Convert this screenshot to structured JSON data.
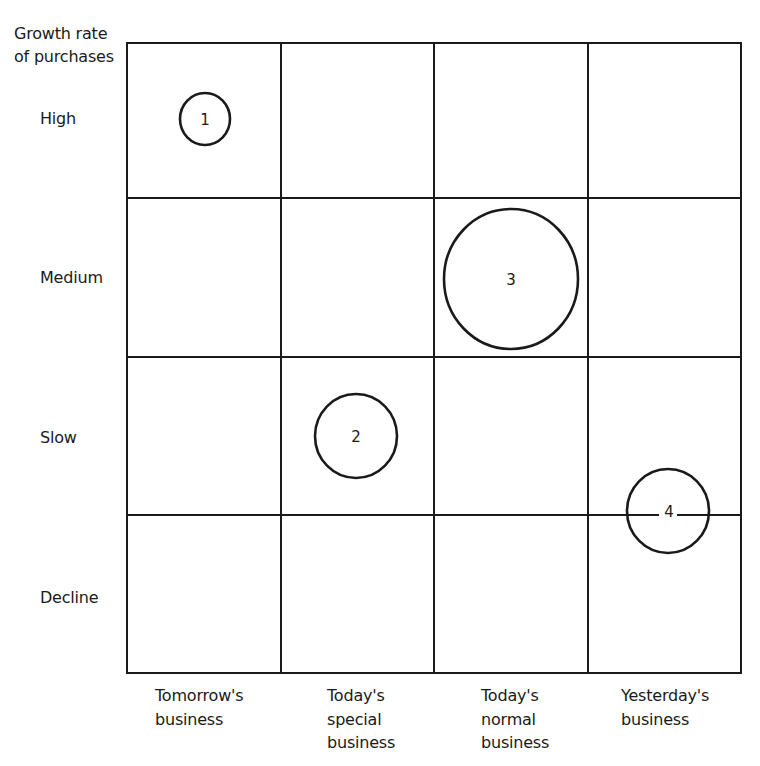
{
  "diagram": {
    "y_axis_title": [
      "Growth rate",
      "of purchases"
    ],
    "rows": [
      {
        "label": "High"
      },
      {
        "label": "Medium"
      },
      {
        "label": "Slow"
      },
      {
        "label": "Decline"
      }
    ],
    "columns": [
      {
        "lines": [
          "Tomorrow's",
          "business"
        ]
      },
      {
        "lines": [
          "Today's",
          "special",
          "business"
        ]
      },
      {
        "lines": [
          "Today's",
          "normal",
          "business"
        ]
      },
      {
        "lines": [
          "Yesterday's",
          "business"
        ]
      }
    ],
    "bubbles": [
      {
        "label": "1",
        "row": "High",
        "column": "Tomorrow's business",
        "relative_size": "small"
      },
      {
        "label": "2",
        "row": "Slow",
        "column": "Today's special business",
        "relative_size": "medium"
      },
      {
        "label": "3",
        "row": "Medium",
        "column": "Today's normal business",
        "relative_size": "large"
      },
      {
        "label": "4",
        "row": "Slow / Decline boundary",
        "column": "Yesterday's business",
        "relative_size": "medium"
      }
    ],
    "colors": {
      "line": "#1a1a1a",
      "background": "#ffffff"
    }
  }
}
